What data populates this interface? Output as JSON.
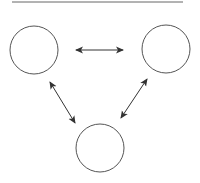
{
  "diagram": {
    "type": "three-node-cycle",
    "colors": {
      "stroke": "#555555",
      "arrow": "#333333",
      "topline": "#666666",
      "background": "#ffffff"
    },
    "top_rule": {
      "x1": 12,
      "y1": 2,
      "x2": 183,
      "y2": 2
    },
    "nodes": [
      {
        "id": "left",
        "label": "",
        "cx": 34,
        "cy": 50,
        "r": 24
      },
      {
        "id": "right",
        "label": "",
        "cx": 166,
        "cy": 49,
        "r": 24
      },
      {
        "id": "bottom",
        "label": "",
        "cx": 100,
        "cy": 148,
        "r": 24
      }
    ],
    "edges": [
      {
        "from": "left",
        "to": "right",
        "bidirectional": true,
        "x1": 76,
        "y1": 50,
        "x2": 123,
        "y2": 50
      },
      {
        "from": "left",
        "to": "bottom",
        "bidirectional": true,
        "x1": 50,
        "y1": 82,
        "x2": 75,
        "y2": 123
      },
      {
        "from": "right",
        "to": "bottom",
        "bidirectional": true,
        "x1": 147,
        "y1": 79,
        "x2": 121,
        "y2": 118
      }
    ]
  }
}
